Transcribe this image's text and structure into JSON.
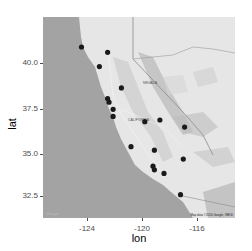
{
  "chart_data": {
    "type": "scatter",
    "title": "",
    "xlabel": "lon",
    "ylabel": "lat",
    "xlim": [
      -127.2,
      -113.2
    ],
    "ylim": [
      31.2,
      42.5
    ],
    "x_ticks": [
      -124,
      -120,
      -116
    ],
    "x_tick_labels": [
      "-124",
      "-120",
      "-116"
    ],
    "y_ticks": [
      32.5,
      35.0,
      37.5,
      40.0
    ],
    "y_tick_labels": [
      "32.5",
      "35.0",
      "37.5",
      "40.0"
    ],
    "background": "Google terrain map (grayscale) of California and Nevada",
    "map_labels": [
      "NEVADA",
      "CALIFORNIA",
      "Las Vegas",
      "Sacramento",
      "San Francisco",
      "San Jose",
      "Fresno",
      "Bakersfield",
      "Los Angeles",
      "San Diego"
    ],
    "points": [
      {
        "lon": -124.4,
        "lat": 40.9
      },
      {
        "lon": -122.5,
        "lat": 40.6
      },
      {
        "lon": -123.1,
        "lat": 39.8
      },
      {
        "lon": -121.5,
        "lat": 38.6
      },
      {
        "lon": -122.5,
        "lat": 38.0
      },
      {
        "lon": -122.4,
        "lat": 37.8
      },
      {
        "lon": -122.1,
        "lat": 37.4
      },
      {
        "lon": -122.1,
        "lat": 37.0
      },
      {
        "lon": -119.8,
        "lat": 36.7
      },
      {
        "lon": -118.7,
        "lat": 36.8
      },
      {
        "lon": -116.9,
        "lat": 36.4
      },
      {
        "lon": -120.8,
        "lat": 35.3
      },
      {
        "lon": -119.1,
        "lat": 35.1
      },
      {
        "lon": -117.0,
        "lat": 34.6
      },
      {
        "lon": -119.2,
        "lat": 34.2
      },
      {
        "lon": -119.1,
        "lat": 34.0
      },
      {
        "lon": -118.4,
        "lat": 33.8
      },
      {
        "lon": -117.2,
        "lat": 32.6
      }
    ],
    "point_color": "#1a1a1a",
    "grid": false,
    "legend": null
  },
  "map": {
    "state_label_nevada": "NEVADA",
    "state_label_california": "CALIFORNIA",
    "attribution": "Map data ©2016 Google, INEGI",
    "logo": "Google"
  },
  "axes": {
    "xlabel": "lon",
    "ylabel": "lat"
  }
}
